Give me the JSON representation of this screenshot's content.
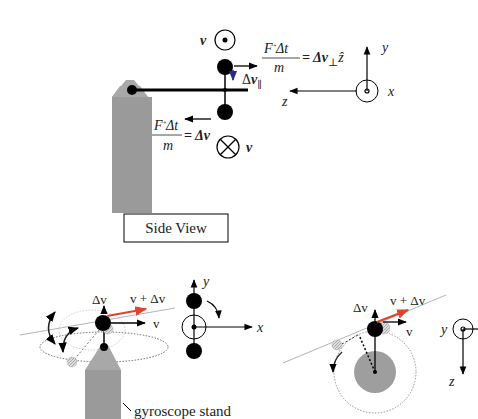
{
  "colors": {
    "ink": "#000000",
    "stand": "#9a9a9a",
    "stand_top": "#a8a8a8",
    "wheel": "#9e9e9e",
    "delta_v_parallel": "#2a2a8a",
    "resultant": "#e0442a",
    "thin_line": "#9aa0a8"
  },
  "side_view": {
    "caption": "Side View",
    "velocity_out_label": "v",
    "velocity_in_label": "v",
    "eq_top": {
      "num": "F Δt",
      "den": "m",
      "rhs": "= Δv",
      "sub": "⊥",
      "hat": "ẑ"
    },
    "eq_bottom": {
      "num": "F Δt",
      "den": "m",
      "rhs": "= Δv"
    },
    "delta_v_parallel": {
      "delta": "Δ",
      "v": "v",
      "sub": "∥"
    },
    "axes": {
      "y": "y",
      "z": "z",
      "x": "x"
    }
  },
  "perspective_view": {
    "delta_v_label": "Δv",
    "resultant_label": "v + Δv",
    "v_label": "v",
    "stand_label": "gyroscope stand"
  },
  "front_axes": {
    "y": "y",
    "x": "x"
  },
  "top_view": {
    "delta_v_label": "Δv",
    "resultant_label": "v + Δv",
    "v_label": "v",
    "axes": {
      "y": "y",
      "z": "z"
    }
  }
}
